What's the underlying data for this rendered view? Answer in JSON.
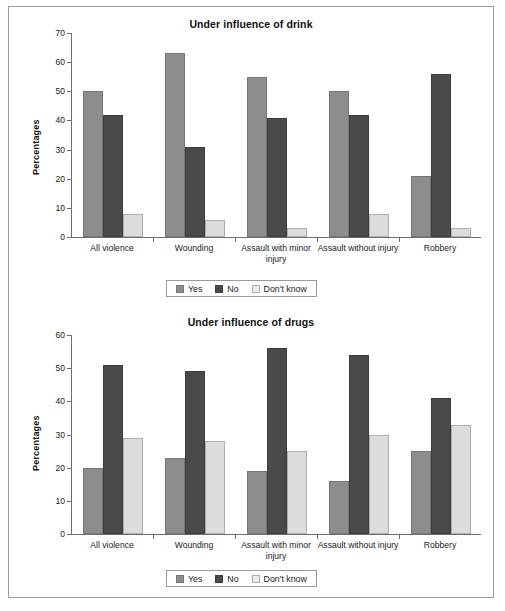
{
  "figure": {
    "background": "#ffffff",
    "frame_color": "#9a9a9a"
  },
  "colors": {
    "yes": "#8d8d8d",
    "no": "#4a4a4a",
    "dont_know": "#dcdcdc"
  },
  "legend": {
    "yes_label": "Yes",
    "no_label": "No",
    "dont_know_label": "Don't know"
  },
  "chart_data": [
    {
      "type": "bar",
      "title": "Under influence of drink",
      "xlabel": "",
      "ylabel": "Percentages",
      "ylim": [
        0,
        70
      ],
      "yticks": [
        0,
        10,
        20,
        30,
        40,
        50,
        60,
        70
      ],
      "grid": false,
      "legend_position": "bottom",
      "categories": [
        "All violence",
        "Wounding",
        "Assault with minor injury",
        "Assault without injury",
        "Robbery"
      ],
      "series": [
        {
          "name": "Yes",
          "values": [
            50,
            63,
            55,
            50,
            21
          ]
        },
        {
          "name": "No",
          "values": [
            42,
            31,
            41,
            42,
            56
          ]
        },
        {
          "name": "Don't know",
          "values": [
            8,
            6,
            3,
            8,
            3
          ]
        }
      ]
    },
    {
      "type": "bar",
      "title": "Under influence of drugs",
      "xlabel": "",
      "ylabel": "Percentages",
      "ylim": [
        0,
        60
      ],
      "yticks": [
        0,
        10,
        20,
        30,
        40,
        50,
        60
      ],
      "grid": false,
      "legend_position": "bottom",
      "categories": [
        "All violence",
        "Wounding",
        "Assault with minor injury",
        "Assault without injury",
        "Robbery"
      ],
      "series": [
        {
          "name": "Yes",
          "values": [
            20,
            23,
            19,
            16,
            25
          ]
        },
        {
          "name": "No",
          "values": [
            51,
            49,
            56,
            54,
            41
          ]
        },
        {
          "name": "Don't know",
          "values": [
            29,
            28,
            25,
            30,
            33
          ]
        }
      ]
    }
  ]
}
